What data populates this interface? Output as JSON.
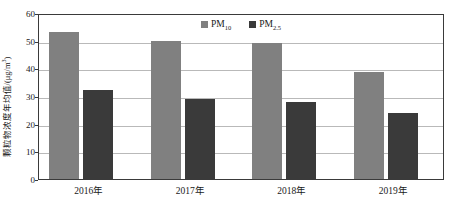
{
  "chart_data": {
    "type": "bar",
    "title": "",
    "subtitle": "",
    "xlabel": "",
    "ylabel": "颗粒物浓度年均值/(μg/m³)",
    "ylabel_prefix": "颗粒物浓度年均值/(μg/m",
    "ylabel_exponent": "3",
    "ylabel_suffix": ")",
    "categories": [
      "2016年",
      "2017年",
      "2018年",
      "2019年"
    ],
    "series": [
      {
        "name": "PM10",
        "label_base": "PM",
        "label_sub": "10",
        "color": "#808080",
        "values": [
          53,
          50,
          49,
          38.5
        ]
      },
      {
        "name": "PM2.5",
        "label_base": "PM",
        "label_sub": "2.5",
        "color": "#3a3a3a",
        "values": [
          32,
          29,
          28,
          24
        ]
      }
    ],
    "ylim": [
      0,
      60
    ],
    "ytick_step": 10,
    "yticks": [
      "0",
      "10",
      "20",
      "30",
      "40",
      "50",
      "60"
    ],
    "grid": "horizontal",
    "legend_position": "top-center",
    "frame": true,
    "colors": {
      "gridline": "#b9b9b9",
      "axis": "#3a3a3a",
      "background": "#ffffff",
      "text": "#1a1a1a"
    }
  }
}
